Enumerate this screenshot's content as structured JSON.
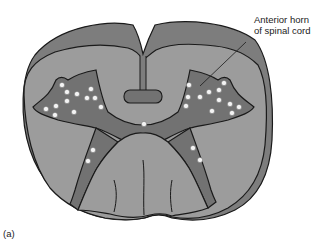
{
  "figure": {
    "panel_label": "(a)",
    "annotation": {
      "line1": "Anterior horn",
      "line2": "of spinal cord"
    },
    "colors": {
      "outer_band": "#7d7d7d",
      "white_matter": "#9c9c9c",
      "gray_matter": "#727272",
      "cell_dots": "#f4f4f4",
      "outline": "#1a1a1a"
    }
  }
}
